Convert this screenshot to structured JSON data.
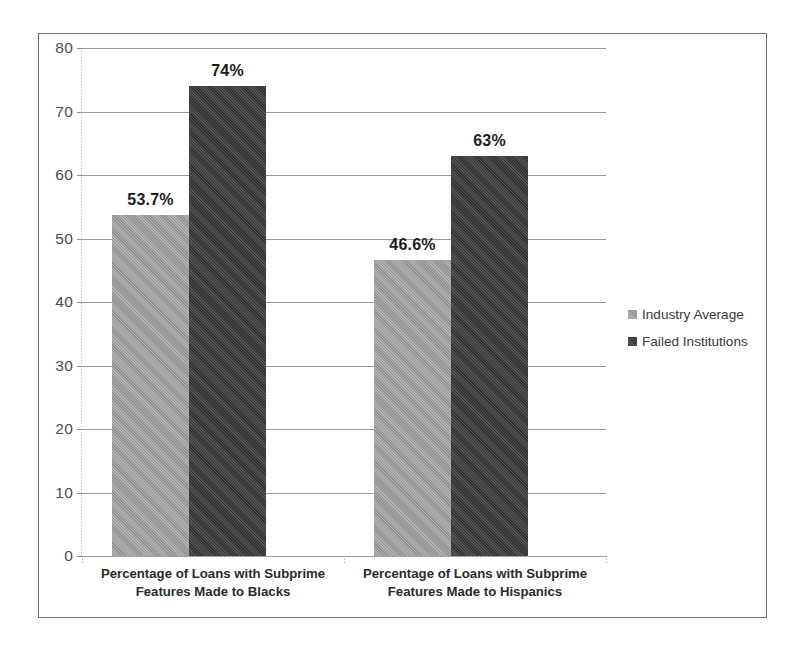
{
  "chart_data": {
    "type": "bar",
    "title": "",
    "subtitle": "",
    "xlabel": "",
    "ylabel": "",
    "ylim": [
      0,
      80
    ],
    "yticks": [
      0,
      10,
      20,
      30,
      40,
      50,
      60,
      70,
      80
    ],
    "ytick_labels": [
      "0",
      "10",
      "20",
      "30",
      "40",
      "50",
      "60",
      "70",
      "80"
    ],
    "grid": true,
    "legend_position": "right",
    "categories": [
      "Percentage of Loans with Subprime\nFeatures Made to Blacks",
      "Percentage of Loans with Subprime\nFeatures Made to Hispanics"
    ],
    "series": [
      {
        "name": "Industry Average",
        "color": "#a2a2a2",
        "values": [
          53.7,
          46.6
        ],
        "data_labels": [
          "53.7%",
          "46.6%"
        ]
      },
      {
        "name": "Failed Institutions",
        "color": "#3b3b3b",
        "values": [
          74,
          63
        ],
        "data_labels": [
          "74%",
          "63%"
        ]
      }
    ]
  },
  "legend": {
    "items": [
      {
        "label": "Industry Average",
        "color": "#a2a2a2"
      },
      {
        "label": "Failed Institutions",
        "color": "#3b3b3b"
      }
    ]
  },
  "axes": {
    "y_axis_name": "value-axis",
    "x_axis_name": "category-axis"
  },
  "colors": {
    "frame_border": "#6e6e6e",
    "gridline": "#9a9a9a",
    "tick_label": "#4c4c4c",
    "category_label": "#2b2b2b",
    "data_label": "#1c1c1c",
    "background": "#ffffff"
  }
}
